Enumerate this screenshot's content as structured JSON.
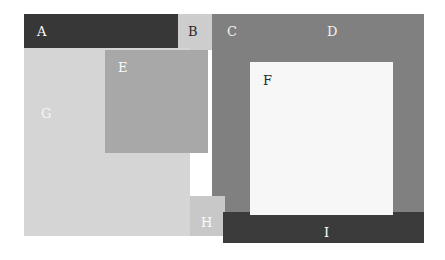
{
  "figure": {
    "width": 445,
    "height": 260,
    "background_color": "#ffffff"
  },
  "regions": [
    {
      "id": "A",
      "label": "A",
      "color": "#373737",
      "label_color": "#ffffff",
      "x": 24,
      "y": 14,
      "width": 154,
      "height": 34
    },
    {
      "id": "B",
      "label": "B",
      "color": "#cdcdcd",
      "label_color": "#2b2b2b",
      "x": 178,
      "y": 14,
      "width": 34,
      "height": 36
    },
    {
      "id": "C",
      "label": "C",
      "color": "#808080",
      "label_color": "#f2f2f2",
      "x": 212,
      "y": 14,
      "width": 212,
      "height": 198
    },
    {
      "id": "D",
      "label": "D",
      "color": "#808080",
      "label_color": "#f2f2f2",
      "x": 212,
      "y": 14,
      "width": 212,
      "height": 198
    },
    {
      "id": "G",
      "label": "G",
      "color": "#d5d5d5",
      "label_color": "#f7f7f7",
      "x": 24,
      "y": 48,
      "width": 166,
      "height": 188
    },
    {
      "id": "E",
      "label": "E",
      "color": "#a8a8a8",
      "label_color": "#fafafa",
      "x": 105,
      "y": 50,
      "width": 103,
      "height": 103
    },
    {
      "id": "F",
      "label": "F",
      "color": "#f7f7f7",
      "label_color": "#2b2b2b",
      "x": 250,
      "y": 62,
      "width": 143,
      "height": 153
    },
    {
      "id": "H",
      "label": "H",
      "color": "#c8c8c8",
      "label_color": "#fbfbfb",
      "x": 190,
      "y": 196,
      "width": 35,
      "height": 40
    },
    {
      "id": "I",
      "label": "I",
      "color": "#3b3b3b",
      "label_color": "#ffffff",
      "x": 223,
      "y": 212,
      "width": 201,
      "height": 31
    }
  ],
  "labels": {
    "a": "A",
    "b": "B",
    "c": "C",
    "d": "D",
    "e": "E",
    "f": "F",
    "g": "G",
    "h": "H",
    "i": "I"
  },
  "colors": {
    "dark_charcoal": "#373737",
    "dark_charcoal_bar": "#3b3b3b",
    "medium_gray": "#808080",
    "overlay_gray": "#a8a8a8",
    "light_gray_b": "#cdcdcd",
    "light_gray_h": "#c8c8c8",
    "light_gray_g": "#d5d5d5",
    "near_white": "#f7f7f7",
    "background": "#ffffff"
  }
}
